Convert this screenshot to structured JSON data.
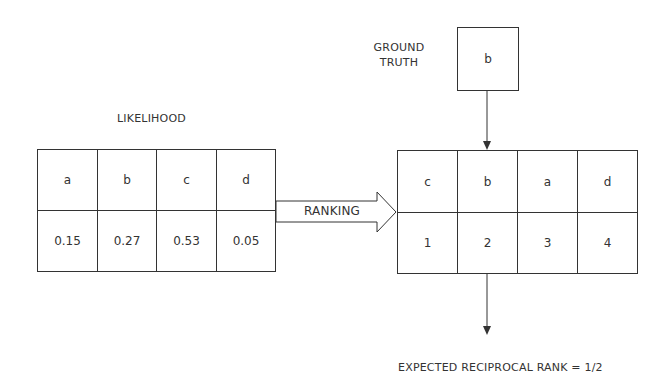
{
  "likelihood": {
    "title": "LIKELIHOOD",
    "labels": [
      "a",
      "b",
      "c",
      "d"
    ],
    "values": [
      "0.15",
      "0.27",
      "0.53",
      "0.05"
    ]
  },
  "ranking_arrow": {
    "label": "RANKING"
  },
  "ground_truth": {
    "title_line1": "GROUND",
    "title_line2": "TRUTH",
    "value": "b"
  },
  "ranked": {
    "labels": [
      "c",
      "b",
      "a",
      "d"
    ],
    "ranks": [
      "1",
      "2",
      "3",
      "4"
    ]
  },
  "result": {
    "text": "EXPECTED RECIPROCAL RANK = 1/2"
  },
  "colors": {
    "stroke": "#333333",
    "text": "#333333",
    "background": "#ffffff"
  }
}
